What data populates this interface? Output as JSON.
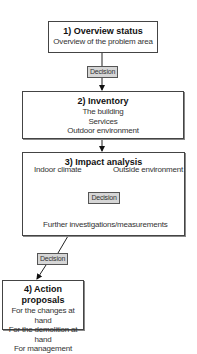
{
  "diagram": {
    "type": "flowchart",
    "steps": [
      {
        "id": 1,
        "title": "1) Overview status",
        "lines": [
          "Overview of the problem area"
        ]
      },
      {
        "id": 2,
        "title": "2) Inventory",
        "lines": [
          "The building",
          "Services",
          "Outdoor environment"
        ]
      },
      {
        "id": 3,
        "title": "3) Impact analysis",
        "inputs": [
          "Indoor climate",
          "Outside environment"
        ],
        "decision": "Decision",
        "outcome": "Further investigations/measurements"
      },
      {
        "id": 4,
        "title": "4) Action proposals",
        "lines": [
          "For the changes at hand",
          "For the demolition at hand",
          "For management"
        ]
      }
    ],
    "decisions": [
      {
        "label": "Decision",
        "between": "1-2"
      },
      {
        "label": "Decision",
        "within": "3"
      },
      {
        "label": "Decision",
        "between": "3-4"
      }
    ]
  }
}
